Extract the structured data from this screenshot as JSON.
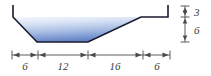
{
  "figure": {
    "type": "engineering-diagram",
    "colors": {
      "outline": "#1a1a2e",
      "water_fill_top": "#eef2fb",
      "water_fill_bottom": "#5b7fc4",
      "dimension_line": "#4a4a4a",
      "label_text": "#3a3a3a",
      "background": "#ffffff"
    },
    "horizontal_dimensions": [
      {
        "label": "6",
        "value": 6,
        "x": 25,
        "y": 66
      },
      {
        "label": "12",
        "value": 12,
        "x": 63,
        "y": 66
      },
      {
        "label": "16",
        "value": 16,
        "x": 115,
        "y": 66
      },
      {
        "label": "6",
        "value": 6,
        "x": 157,
        "y": 66
      }
    ],
    "vertical_dimensions": [
      {
        "label": "3",
        "value": 3,
        "x": 197,
        "y": 12
      },
      {
        "label": "6",
        "value": 6,
        "x": 197,
        "y": 30
      }
    ]
  }
}
